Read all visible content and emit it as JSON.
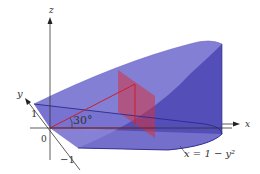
{
  "figure": {
    "axes": {
      "x_label": "x",
      "y_label": "y",
      "z_label": "z"
    },
    "ticks": {
      "origin": "0",
      "y_pos": "1",
      "y_neg": "−1"
    },
    "angle_label": "30°",
    "curve_label": "x = 1 − y²",
    "colors": {
      "solid_fill": "#5a55c0",
      "solid_light": "#8c88d6",
      "section_fill": "#d4333f",
      "edge": "#2a2a8a",
      "axis": "#333333"
    }
  }
}
